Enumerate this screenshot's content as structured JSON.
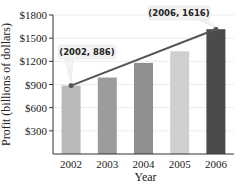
{
  "chart_data": {
    "type": "bar",
    "title": "",
    "xlabel": "Year",
    "ylabel": "Profit (billions of dollars)",
    "categories": [
      "2002",
      "2003",
      "2004",
      "2005",
      "2006"
    ],
    "values": [
      886,
      990,
      1180,
      1330,
      1616
    ],
    "bar_colors": [
      "#b9b9b9",
      "#9c9c9c",
      "#8f8f8f",
      "#cfcfcf",
      "#4b4b4b"
    ],
    "ylim": [
      0,
      1800
    ],
    "yticks": [
      300,
      600,
      900,
      1200,
      1500,
      1800
    ],
    "ytick_labels": [
      "$300",
      "$600",
      "$900",
      "$1200",
      "$1500",
      "$1800"
    ],
    "grid": true,
    "trend_line": {
      "from": {
        "x": "2002",
        "y": 886
      },
      "to": {
        "x": "2006",
        "y": 1616
      },
      "color": "#555555"
    },
    "annotations": [
      {
        "text": "(2002, 886)",
        "x": "2002",
        "y": 886
      },
      {
        "text": "(2006, 1616)",
        "x": "2006",
        "y": 1616
      }
    ]
  }
}
